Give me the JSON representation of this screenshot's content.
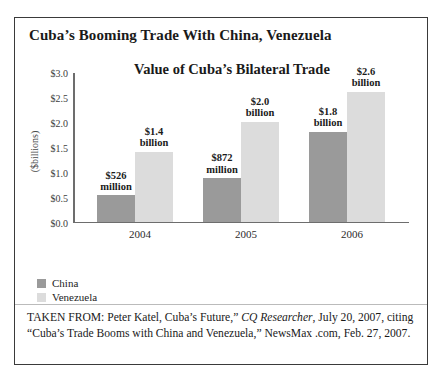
{
  "figure": {
    "title": "Cuba’s Booming Trade With China, Venezuela"
  },
  "source_note": {
    "prefix": "TAKEN FROM: Peter Katel, Cuba’s Future,” ",
    "italic": "CQ Researcher",
    "suffix": ", July 20, 2007, citing “Cuba’s Trade Booms with China and Venezuela,” NewsMax .com, Feb. 27, 2007."
  },
  "legend": {
    "items": [
      {
        "label": "China",
        "color": "#9a9a9a"
      },
      {
        "label": "Venezuela",
        "color": "#dcdcdc"
      }
    ]
  },
  "chart_data": {
    "type": "bar",
    "title": "Value of Cuba’s Bilateral Trade",
    "xlabel": "",
    "ylabel": "($billions)",
    "ylim": [
      0,
      3.0
    ],
    "ytick_labels": [
      "$3.0",
      "$2.5",
      "$2.0",
      "$1.5",
      "$1.0",
      "$0.5",
      "$0.0"
    ],
    "ytick_values": [
      3.0,
      2.5,
      2.0,
      1.5,
      1.0,
      0.5,
      0.0
    ],
    "grid": false,
    "legend_position": "below-left",
    "categories": [
      "2004",
      "2005",
      "2006"
    ],
    "series": [
      {
        "name": "China",
        "color": "#9a9a9a",
        "values": [
          0.526,
          0.872,
          1.8
        ],
        "data_labels": [
          "$526 million",
          "$872 million",
          "$1.8 billion"
        ]
      },
      {
        "name": "Venezuela",
        "color": "#dcdcdc",
        "values": [
          1.4,
          2.0,
          2.6
        ],
        "data_labels": [
          "$1.4 billion",
          "$2.0 billion",
          "$2.6 billion"
        ]
      }
    ]
  }
}
